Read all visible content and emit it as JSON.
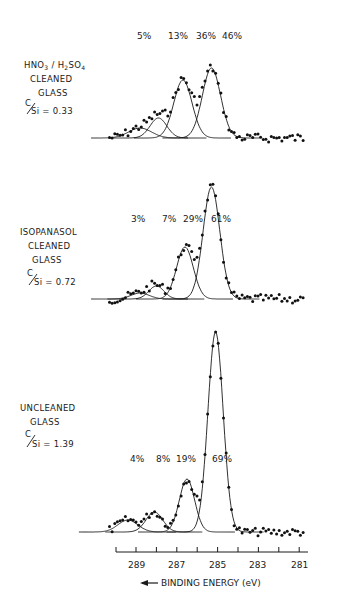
{
  "chart_data": {
    "type": "scatter",
    "xlabel": "BINDING ENERGY (eV)",
    "xlabel_arrow": "←",
    "x_ticks": [
      289,
      288,
      287,
      286,
      285,
      284,
      283,
      282,
      281
    ],
    "x_tick_labels": [
      "289",
      "287",
      "285",
      "283",
      "281"
    ],
    "xlim": [
      290,
      280.5
    ],
    "x_reversed": true,
    "grid": false,
    "panels": [
      {
        "label_lines": [
          "HNO3 / H2SO4",
          "CLEANED",
          "GLASS"
        ],
        "ratio_label": "C/Si = 0.33",
        "ratio": 0.33,
        "components": [
          {
            "percent": "5%",
            "center_eV": 288.8,
            "height": 10,
            "width": 0.75
          },
          {
            "percent": "13%",
            "center_eV": 287.9,
            "height": 20,
            "width": 0.55
          },
          {
            "percent": "36%",
            "center_eV": 286.7,
            "height": 58,
            "width": 0.6
          },
          {
            "percent": "46%",
            "center_eV": 285.3,
            "height": 70,
            "width": 0.6
          }
        ]
      },
      {
        "label_lines": [
          "ISOPANASOL",
          "CLEANED",
          "GLASS"
        ],
        "ratio_label": "C/Si = 0.72",
        "ratio": 0.72,
        "components": [
          {
            "percent": "3%",
            "center_eV": 288.8,
            "height": 6,
            "width": 0.6
          },
          {
            "percent": "7%",
            "center_eV": 288.0,
            "height": 13,
            "width": 0.5
          },
          {
            "percent": "29%",
            "center_eV": 286.6,
            "height": 52,
            "width": 0.55
          },
          {
            "percent": "61%",
            "center_eV": 285.3,
            "height": 112,
            "width": 0.55
          }
        ]
      },
      {
        "label_lines": [
          "UNCLEANED",
          "GLASS"
        ],
        "ratio_label": "C/Si = 1.39",
        "ratio": 1.39,
        "components": [
          {
            "percent": "4%",
            "center_eV": 289.4,
            "height": 12,
            "width": 0.65
          },
          {
            "percent": "8%",
            "center_eV": 288.1,
            "height": 20,
            "width": 0.55
          },
          {
            "percent": "19%",
            "center_eV": 286.5,
            "height": 53,
            "width": 0.5
          },
          {
            "percent": "69%",
            "center_eV": 285.1,
            "height": 200,
            "width": 0.5
          }
        ]
      }
    ]
  },
  "labels": {
    "panel1": {
      "line1": "HNO",
      "sub1": "3",
      "slash": " / H",
      "sub2": "2",
      "so": "SO",
      "sub3": "4",
      "line2": "CLEANED",
      "line3": "GLASS",
      "ratio_c": "C",
      "ratio_rest": "Si = 0.33"
    },
    "panel2": {
      "line1": "ISOPANASOL",
      "line2": "CLEANED",
      "line3": "GLASS",
      "ratio_c": "C",
      "ratio_rest": "Si = 0.72"
    },
    "panel3": {
      "line1": "UNCLEANED",
      "line2": "GLASS",
      "ratio_c": "C",
      "ratio_rest": "Si = 1.39"
    },
    "axis_title": "BINDING ENERGY (eV)",
    "ticks": [
      "289",
      "287",
      "285",
      "283",
      "281"
    ]
  }
}
